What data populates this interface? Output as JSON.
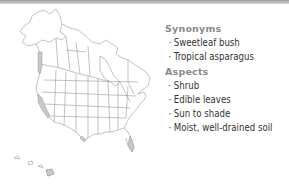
{
  "map": {
    "region": "North America (USA, Canada, Alaska, Hawaii)",
    "highlighted_areas": [
      "Pacific coast",
      "California coast",
      "Southern Texas",
      "Florida",
      "Hawaii"
    ]
  },
  "panel": {
    "sections": [
      {
        "heading": "Synonyms",
        "items": [
          "Sweetleaf bush",
          "Tropical asparagus"
        ]
      },
      {
        "heading": "Aspects",
        "items": [
          "Shrub",
          "Edible leaves",
          "Sun to shade",
          "Moist, well-drained soil"
        ]
      }
    ],
    "bullet": "·"
  },
  "colors": {
    "heading": "#8a8a8a",
    "item_text": "#333333",
    "map_lines": "#9a9a9a",
    "map_highlight": "#c8c8c8",
    "top_bar": "#a0a0a0"
  }
}
